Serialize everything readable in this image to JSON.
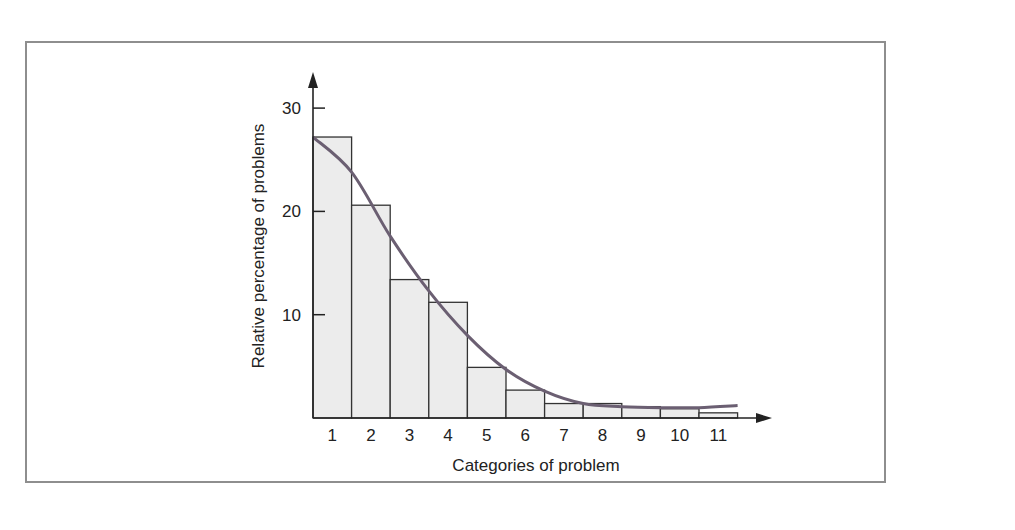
{
  "chart_data": {
    "type": "bar",
    "title": "",
    "xlabel": "Categories of problem",
    "ylabel": "Relative percentage of problems",
    "categories": [
      "1",
      "2",
      "3",
      "4",
      "5",
      "6",
      "7",
      "8",
      "9",
      "10",
      "11"
    ],
    "values": [
      27.2,
      20.6,
      13.4,
      11.2,
      4.9,
      2.7,
      1.4,
      1.4,
      1.1,
      0.9,
      0.5
    ],
    "series": [
      {
        "name": "Relative percentage",
        "type": "bar",
        "values": [
          27.2,
          20.6,
          13.4,
          11.2,
          4.9,
          2.7,
          1.4,
          1.4,
          1.1,
          0.9,
          0.5
        ]
      },
      {
        "name": "Fitted curve",
        "type": "line",
        "values": [
          23.8,
          17.6,
          12.3,
          8.0,
          4.7,
          2.6,
          1.4,
          1.1,
          1.0,
          1.0,
          1.2
        ]
      }
    ],
    "ylim": [
      0,
      30
    ],
    "yticks": [
      "10",
      "20",
      "30"
    ],
    "grid": false,
    "legend": "none",
    "colors": {
      "bar_fill": "#ececec",
      "bar_stroke": "#333333",
      "curve": "#6b5f72",
      "frame": "#8e8e8e",
      "axis": "#222222"
    }
  }
}
